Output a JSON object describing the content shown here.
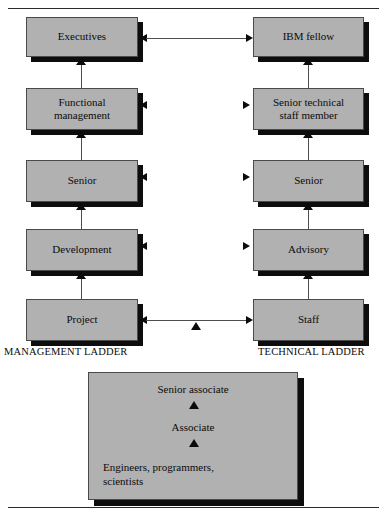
{
  "diagram": {
    "box_fill_color": "#b1b1b1",
    "shadow_color": "#0d0d0d",
    "border_color": "#4a4a4a"
  },
  "rules": {
    "top": "",
    "bottom": ""
  },
  "ladders": {
    "management_label": "MANAGEMENT LADDER",
    "technical_label": "TECHNICAL LADDER"
  },
  "management_ladder": {
    "boxes": [
      {
        "label": "Executives"
      },
      {
        "label": "Functional\nmanagement"
      },
      {
        "label": "Senior"
      },
      {
        "label": "Development"
      },
      {
        "label": "Project"
      }
    ]
  },
  "technical_ladder": {
    "boxes": [
      {
        "label": "IBM fellow"
      },
      {
        "label": "Senior technical\nstaff member"
      },
      {
        "label": "Senior"
      },
      {
        "label": "Advisory"
      },
      {
        "label": "Staff"
      }
    ]
  },
  "cross_links": [
    {
      "row": 1,
      "type": "double-arrow",
      "from": "Executives",
      "to": "IBM fellow"
    },
    {
      "row": 2,
      "type": "arrowheads-only",
      "from": "Functional management",
      "to": "Senior technical staff member"
    },
    {
      "row": 3,
      "type": "arrowheads-only",
      "from": "Senior",
      "to": "Senior"
    },
    {
      "row": 4,
      "type": "arrowheads-only",
      "from": "Development",
      "to": "Advisory"
    },
    {
      "row": 5,
      "type": "double-arrow-with-entry",
      "from": "Project",
      "to": "Staff"
    }
  ],
  "base_panel": {
    "level_top": "Senior associate",
    "level_middle": "Associate",
    "level_bottom": "Engineers, programmers,\nscientists"
  }
}
